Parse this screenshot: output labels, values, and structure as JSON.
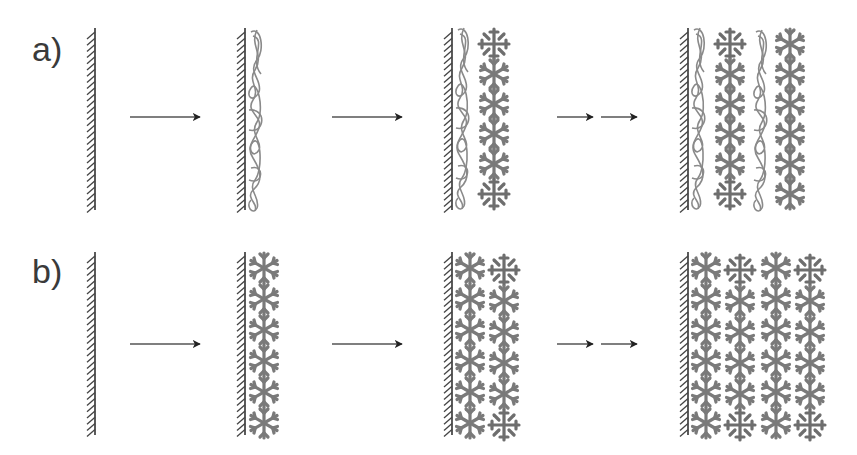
{
  "diagram": {
    "rows": [
      {
        "label": "a)",
        "description": "Alternating polymer chain and flake-particle layers on a wall",
        "stages": [
          {
            "wall_x": 95,
            "content": "bare wall"
          },
          {
            "wall_x": 245,
            "content": "polymer coil layer"
          },
          {
            "wall_x": 452,
            "content": "polymer layer + particle column"
          },
          {
            "wall_x": 688,
            "content": "polymer/particle/polymer/particle layers"
          }
        ],
        "arrows": [
          {
            "type": "single",
            "x1": 130,
            "x2": 200,
            "y": 117
          },
          {
            "type": "single",
            "x1": 332,
            "x2": 402,
            "y": 117
          },
          {
            "type": "double",
            "x1": 557,
            "x2": 637,
            "y": 117
          }
        ]
      },
      {
        "label": "b)",
        "description": "Successive flake-particle layers on a wall",
        "stages": [
          {
            "wall_x": 95,
            "content": "bare wall"
          },
          {
            "wall_x": 245,
            "content": "one particle layer"
          },
          {
            "wall_x": 452,
            "content": "two particle layers"
          },
          {
            "wall_x": 688,
            "content": "four particle layers"
          }
        ],
        "arrows": [
          {
            "type": "single",
            "x1": 130,
            "x2": 200,
            "y": 344
          },
          {
            "type": "single",
            "x1": 332,
            "x2": 402,
            "y": 344
          },
          {
            "type": "double",
            "x1": 557,
            "x2": 637,
            "y": 344
          }
        ]
      }
    ],
    "colors": {
      "ink": "#333333",
      "particle": "#7a7a7a",
      "polymer": "#8a8a8a",
      "background": "#ffffff"
    }
  }
}
